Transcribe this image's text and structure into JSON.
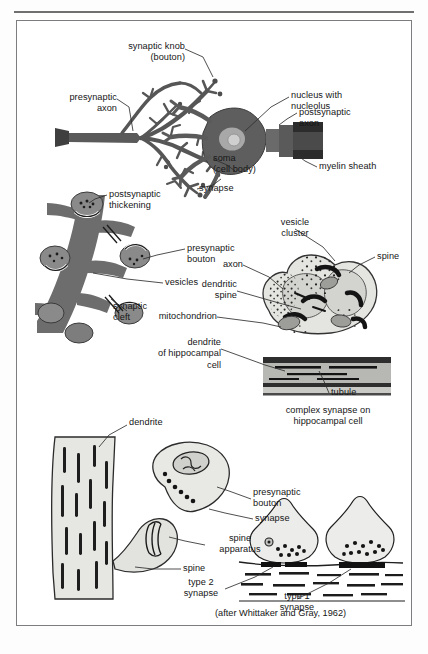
{
  "page": {
    "running_head": "",
    "credit": "(after Whittaker and Gray, 1962)"
  },
  "figure": {
    "panels": [
      {
        "id": "panel-neuron",
        "name": "presynaptic-axon-onto-neuron",
        "labels": [
          {
            "key": "synaptic_knob",
            "text": "synaptic knob\n(bouton)"
          },
          {
            "key": "presynaptic_axon",
            "text": "presynaptic\naxon"
          },
          {
            "key": "nucleus",
            "text": "nucleus with\nnucleolus"
          },
          {
            "key": "postsynaptic_axon",
            "text": "postsynaptic\naxon"
          },
          {
            "key": "myelin_sheath",
            "text": "myelin sheath"
          },
          {
            "key": "soma",
            "text": "soma\n(cell body)"
          },
          {
            "key": "synapse",
            "text": "synapse"
          }
        ]
      },
      {
        "id": "panel-boutons",
        "name": "boutons-on-dendrite",
        "labels": [
          {
            "key": "postsynaptic_thickening",
            "text": "postsynaptic\nthickening"
          },
          {
            "key": "presynaptic_bouton",
            "text": "presynaptic\nbouton"
          },
          {
            "key": "vesicles",
            "text": "vesicles"
          },
          {
            "key": "synaptic_cleft",
            "text": "synaptic\ncleft"
          }
        ]
      },
      {
        "id": "panel-complex-synapse",
        "name": "complex-synapse-hippocampal",
        "caption": "complex synapse on\nhippocampal cell",
        "labels": [
          {
            "key": "vesicle_cluster",
            "text": "vesicle\ncluster"
          },
          {
            "key": "spine",
            "text": "spine"
          },
          {
            "key": "axon",
            "text": "axon"
          },
          {
            "key": "dendritic_spine",
            "text": "dendritic\nspine"
          },
          {
            "key": "mitochondrion",
            "text": "mitochondrion"
          },
          {
            "key": "dendrite_hippo",
            "text": "dendrite\nof hippocampal\ncell"
          },
          {
            "key": "tubule",
            "text": "tubule"
          }
        ]
      },
      {
        "id": "panel-spine",
        "name": "dendritic-spine-detail",
        "labels": [
          {
            "key": "dendrite",
            "text": "dendrite"
          },
          {
            "key": "presynaptic_bouton",
            "text": "presynaptic\nbouton"
          },
          {
            "key": "synapse",
            "text": "synapse"
          },
          {
            "key": "spine_apparatus",
            "text": "spine\napparatus"
          },
          {
            "key": "spine",
            "text": "spine"
          }
        ]
      },
      {
        "id": "panel-types",
        "name": "synapse-types",
        "labels": [
          {
            "key": "type2",
            "text": "type 2\nsynapse"
          },
          {
            "key": "type1",
            "text": "type 1\nsynapse"
          }
        ]
      }
    ]
  },
  "colors": {
    "frame_border": "#7d7d80",
    "neuron_dark": "#4a4a4a",
    "neuron_mid": "#6e6e6e",
    "bouton_gray": "#7d7d7d",
    "cell_light": "#d8d8d4",
    "cell_lighter": "#e8e8e4",
    "dendrite_band": "#b9b9b5",
    "ink": "#161616",
    "leader": "#3a3a3a",
    "page_bg": "#ffffff"
  }
}
